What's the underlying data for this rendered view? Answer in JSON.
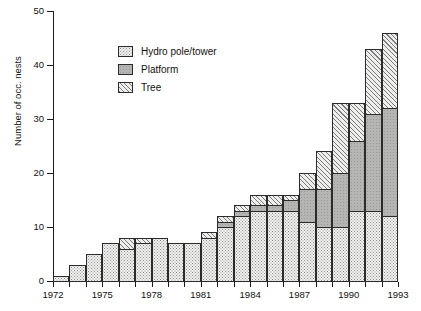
{
  "chart_data": {
    "type": "bar",
    "subtype": "stacked-bar",
    "title": "",
    "xlabel": "",
    "ylabel": "Number of occ. nests",
    "ylim": [
      0,
      50
    ],
    "yticks": [
      0,
      10,
      20,
      30,
      40,
      50
    ],
    "xlim": [
      1972,
      1993
    ],
    "xticks": [
      1972,
      1973,
      1974,
      1975,
      1976,
      1977,
      1978,
      1979,
      1980,
      1981,
      1982,
      1983,
      1984,
      1985,
      1986,
      1987,
      1988,
      1989,
      1990,
      1991,
      1992,
      1993
    ],
    "xtick_labels_shown": [
      1972,
      1975,
      1978,
      1981,
      1984,
      1987,
      1990,
      1993
    ],
    "grid": false,
    "legend_position": "upper-left-inside",
    "categories": [
      1973,
      1974,
      1975,
      1976,
      1977,
      1978,
      1979,
      1980,
      1981,
      1982,
      1983,
      1984,
      1985,
      1986,
      1987,
      1988,
      1989,
      1990,
      1991,
      1992,
      1993
    ],
    "series": [
      {
        "name": "Hydro pole/tower",
        "fill": "stipple",
        "values": [
          1,
          3,
          5,
          7,
          6,
          7,
          8,
          7,
          7,
          8,
          10,
          12,
          13,
          13,
          13,
          11,
          10,
          10,
          13,
          13,
          12
        ]
      },
      {
        "name": "Platform",
        "fill": "solid-grey",
        "values": [
          0,
          0,
          0,
          0,
          0,
          0,
          0,
          0,
          0,
          0,
          1,
          1,
          1,
          1,
          2,
          6,
          7,
          10,
          13,
          18,
          20
        ]
      },
      {
        "name": "Tree",
        "fill": "diagonal-hatch",
        "values": [
          0,
          0,
          0,
          0,
          2,
          1,
          0,
          0,
          0,
          1,
          1,
          1,
          2,
          2,
          1,
          3,
          7,
          13,
          7,
          12,
          14
        ]
      }
    ],
    "totals": [
      1,
      3,
      5,
      7,
      8,
      8,
      8,
      7,
      7,
      9,
      12,
      14,
      16,
      16,
      16,
      20,
      24,
      33,
      33,
      43,
      46
    ]
  },
  "legend": {
    "items": [
      {
        "label": "Hydro pole/tower",
        "swatch": "stipple-swatch"
      },
      {
        "label": "Platform",
        "swatch": "solid-grey-swatch"
      },
      {
        "label": "Tree",
        "swatch": "diagonal-hatch-swatch"
      }
    ]
  },
  "axes": {
    "y_title": "Number of occ. nests",
    "y_tick_labels": [
      "0",
      "10",
      "20",
      "30",
      "40",
      "50"
    ],
    "x_tick_labels": [
      "1972",
      "1975",
      "1978",
      "1981",
      "1984",
      "1987",
      "1990",
      "1993"
    ]
  },
  "colors": {
    "axis": "#1a1a1a",
    "bar_outline": "#2b2b2b",
    "hydro_fill": "#f2f2ef",
    "platform_fill": "#b5b5b3",
    "tree_fill": "#eeeeec",
    "hatch": "#7b7b7b",
    "background": "#ffffff"
  }
}
